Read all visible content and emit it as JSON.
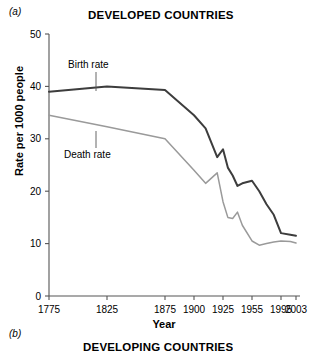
{
  "figure": {
    "panel_a_tag": "(a)",
    "panel_b_tag": "(b)",
    "panel_a_title": "DEVELOPED COUNTRIES",
    "panel_b_title": "DEVELOPING COUNTRIES"
  },
  "chart_data": {
    "type": "line",
    "title": "DEVELOPED COUNTRIES",
    "xlabel": "Year",
    "ylabel": "Rate per 1000 people",
    "ylim": [
      0,
      50
    ],
    "yticks": [
      0,
      10,
      20,
      30,
      40,
      50
    ],
    "ytick_labels": [
      "0",
      "10",
      "20",
      "30",
      "40",
      "50"
    ],
    "xtick_labels": [
      "1775",
      "1825",
      "1875",
      "1900",
      "1925",
      "1955",
      "1995",
      "2003"
    ],
    "xtick_values": [
      1775,
      1825,
      1875,
      1900,
      1925,
      1955,
      1995,
      2003
    ],
    "grid": false,
    "legend": "inline-annotations",
    "annotations": [
      {
        "text": "Birth rate",
        "series": "Birth rate"
      },
      {
        "text": "Death rate",
        "series": "Death rate"
      }
    ],
    "series": [
      {
        "name": "Birth rate",
        "color": "#3d3d3d",
        "width": 2.0,
        "x": [
          1775,
          1825,
          1875,
          1900,
          1910,
          1920,
          1925,
          1930,
          1935,
          1940,
          1945,
          1955,
          1965,
          1975,
          1985,
          1995,
          2000,
          2003
        ],
        "values": [
          39.0,
          40.0,
          39.3,
          34.5,
          32.0,
          26.5,
          28.0,
          24.5,
          23.0,
          21.0,
          21.5,
          22.0,
          20.0,
          17.5,
          15.5,
          12.0,
          11.7,
          11.5
        ]
      },
      {
        "name": "Death rate",
        "color": "#9a9a9a",
        "width": 1.5,
        "x": [
          1775,
          1825,
          1875,
          1900,
          1910,
          1920,
          1925,
          1930,
          1935,
          1940,
          1945,
          1955,
          1965,
          1975,
          1985,
          1995,
          2000,
          2003
        ],
        "values": [
          34.5,
          32.3,
          30.0,
          24.0,
          21.5,
          23.5,
          18.0,
          15.0,
          14.8,
          16.0,
          13.5,
          10.5,
          9.7,
          10.0,
          10.3,
          10.5,
          10.4,
          10.1
        ]
      }
    ]
  }
}
